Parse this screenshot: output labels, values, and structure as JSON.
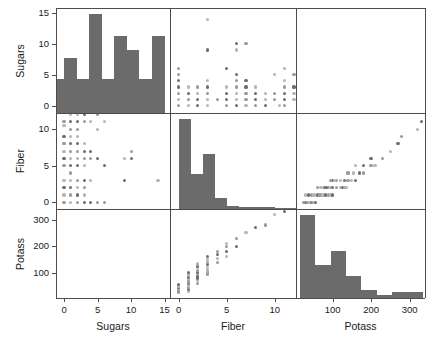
{
  "figure": {
    "type": "scatterplot-matrix",
    "variables": [
      "Sugars",
      "Fiber",
      "Potass"
    ],
    "diagonal": "histogram",
    "point_color": "#8c8c8c",
    "bar_color": "#6b6b6b",
    "frame_color": "#4d4d4d",
    "background": "#ffffff"
  },
  "labels": {
    "sugars": "Sugars",
    "fiber": "Fiber",
    "potass": "Potass"
  },
  "axes": {
    "sugars": {
      "min": -1.2,
      "max": 15.8,
      "ticks": [
        0,
        5,
        10,
        15
      ],
      "ticks_x": [
        0,
        10
      ]
    },
    "fiber": {
      "min": -0.9,
      "max": 12.2,
      "ticks": [
        0,
        5,
        10
      ],
      "ticks_x": [
        0,
        5,
        10
      ]
    },
    "potass": {
      "min": 5,
      "max": 340,
      "ticks": [
        100,
        200,
        300
      ],
      "ticks_x": [
        100,
        200,
        300
      ]
    }
  },
  "chart_data": {
    "type": "scatter",
    "title": "",
    "xlabel": "",
    "ylabel": "",
    "variables": [
      "Sugars",
      "Fiber",
      "Potass"
    ],
    "axis_ranges": {
      "Sugars": [
        -1.2,
        15.8
      ],
      "Fiber": [
        -0.9,
        12.2
      ],
      "Potass": [
        5,
        340
      ]
    },
    "tick_labels": {
      "Sugars": [
        0,
        5,
        10,
        15
      ],
      "Fiber": [
        0,
        5,
        10
      ],
      "Potass": [
        100,
        200,
        300
      ]
    },
    "grid": false,
    "legend": "none",
    "histograms": {
      "Sugars": {
        "bin_edges": [
          0,
          1.875,
          3.75,
          5.625,
          7.5,
          9.375,
          11.25,
          13.125,
          15
        ],
        "counts": [
          8.2,
          2.9,
          14.7,
          5.0,
          11.5,
          9.3,
          5.0,
          11.5
        ],
        "baseline_count": 5.0
      },
      "Fiber": {
        "bin_edges": [
          0,
          1.25,
          2.5,
          3.75,
          5.0,
          6.25,
          7.5,
          8.75,
          10,
          11.25,
          12.5,
          13.75
        ],
        "counts": [
          11.8,
          4.6,
          7.2,
          1.4,
          0.35,
          0.25,
          0.25,
          0.25,
          0.15,
          0.1,
          0.25
        ]
      },
      "Potass": {
        "bin_edges": [
          15,
          55,
          95,
          135,
          175,
          215,
          255,
          295,
          335
        ],
        "counts": [
          300,
          120,
          170,
          80,
          30,
          12,
          20,
          22
        ]
      }
    },
    "points": {
      "Sugars_Fiber": [
        [
          0.0,
          13.0
        ],
        [
          0.0,
          11.0
        ],
        [
          0.0,
          10.5
        ],
        [
          0.0,
          9.0
        ],
        [
          0.0,
          8.0
        ],
        [
          0.0,
          7.0
        ],
        [
          0.0,
          6.0
        ],
        [
          0.0,
          5.0
        ],
        [
          0.0,
          3.0
        ],
        [
          0.0,
          2.0
        ],
        [
          0.0,
          0.0
        ],
        [
          0.0,
          1.0
        ],
        [
          1.0,
          14.0
        ],
        [
          1.0,
          13.0
        ],
        [
          1.0,
          12.0
        ],
        [
          1.0,
          11.0
        ],
        [
          1.0,
          10.0
        ],
        [
          1.0,
          9.0
        ],
        [
          1.0,
          8.0
        ],
        [
          1.0,
          7.0
        ],
        [
          1.0,
          6.0
        ],
        [
          1.0,
          5.0
        ],
        [
          1.0,
          4.0
        ],
        [
          1.0,
          3.0
        ],
        [
          1.0,
          2.0
        ],
        [
          1.0,
          1.0
        ],
        [
          1.0,
          0.0
        ],
        [
          2.0,
          15.0
        ],
        [
          2.0,
          14.0
        ],
        [
          2.0,
          12.0
        ],
        [
          2.0,
          11.0
        ],
        [
          2.0,
          10.0
        ],
        [
          2.0,
          9.0
        ],
        [
          2.0,
          8.0
        ],
        [
          2.0,
          7.0
        ],
        [
          2.0,
          6.0
        ],
        [
          2.0,
          5.0
        ],
        [
          2.0,
          3.0
        ],
        [
          2.0,
          2.0
        ],
        [
          2.0,
          1.0
        ],
        [
          2.0,
          0.0
        ],
        [
          3.0,
          14.0
        ],
        [
          3.0,
          12.0
        ],
        [
          3.0,
          11.0
        ],
        [
          3.0,
          8.0
        ],
        [
          3.0,
          7.0
        ],
        [
          3.0,
          6.0
        ],
        [
          3.0,
          5.0
        ],
        [
          3.0,
          3.0
        ],
        [
          3.0,
          2.0
        ],
        [
          3.0,
          1.0
        ],
        [
          3.0,
          0.0
        ],
        [
          4.0,
          13.0
        ],
        [
          4.0,
          11.0
        ],
        [
          4.0,
          7.0
        ],
        [
          4.0,
          6.0
        ],
        [
          4.0,
          3.0
        ],
        [
          4.0,
          0.0
        ],
        [
          5.0,
          12.0
        ],
        [
          5.0,
          10.0
        ],
        [
          5.0,
          6.0
        ],
        [
          5.0,
          0.0
        ],
        [
          6.0,
          11.0
        ],
        [
          6.0,
          5.0
        ],
        [
          6.0,
          0.0
        ],
        [
          9.0,
          6.0
        ],
        [
          10.0,
          6.0
        ],
        [
          10.0,
          7.0
        ],
        [
          14.0,
          3.0
        ],
        [
          9.0,
          3.0
        ]
      ],
      "Sugars_Potass": [
        [
          30,
          15
        ],
        [
          35,
          14
        ],
        [
          40,
          13
        ],
        [
          45,
          13
        ],
        [
          48,
          12
        ],
        [
          50,
          14
        ],
        [
          55,
          13
        ],
        [
          58,
          12
        ],
        [
          35,
          11
        ],
        [
          42,
          11
        ],
        [
          50,
          11
        ],
        [
          60,
          10
        ],
        [
          65,
          12
        ],
        [
          70,
          11
        ],
        [
          75,
          10
        ],
        [
          45,
          9
        ],
        [
          55,
          9
        ],
        [
          62,
          8
        ],
        [
          68,
          9
        ],
        [
          72,
          8
        ],
        [
          80,
          9
        ],
        [
          90,
          8
        ],
        [
          50,
          7
        ],
        [
          60,
          7
        ],
        [
          70,
          7
        ],
        [
          78,
          6
        ],
        [
          85,
          7
        ],
        [
          95,
          6
        ],
        [
          105,
          7
        ],
        [
          115,
          6
        ],
        [
          55,
          5
        ],
        [
          65,
          5
        ],
        [
          75,
          5
        ],
        [
          85,
          5
        ],
        [
          95,
          5
        ],
        [
          110,
          5
        ],
        [
          120,
          5
        ],
        [
          130,
          4
        ],
        [
          60,
          3
        ],
        [
          72,
          3
        ],
        [
          82,
          3
        ],
        [
          92,
          3
        ],
        [
          100,
          3
        ],
        [
          115,
          3
        ],
        [
          125,
          3
        ],
        [
          140,
          3
        ],
        [
          30,
          2
        ],
        [
          45,
          2
        ],
        [
          55,
          2
        ],
        [
          65,
          2
        ],
        [
          80,
          2
        ],
        [
          95,
          2
        ],
        [
          110,
          2
        ],
        [
          125,
          2
        ],
        [
          30,
          1
        ],
        [
          40,
          1
        ],
        [
          50,
          1
        ],
        [
          55,
          1
        ],
        [
          60,
          1
        ],
        [
          70,
          1
        ],
        [
          88,
          1
        ],
        [
          100,
          1
        ],
        [
          30,
          0
        ],
        [
          38,
          0
        ],
        [
          45,
          0
        ],
        [
          52,
          0
        ],
        [
          60,
          0
        ],
        [
          75,
          0
        ],
        [
          90,
          0
        ],
        [
          105,
          0
        ],
        [
          125,
          0
        ],
        [
          140,
          0
        ],
        [
          160,
          5
        ],
        [
          175,
          8
        ],
        [
          190,
          3
        ],
        [
          230,
          2
        ],
        [
          280,
          5
        ],
        [
          320,
          4
        ],
        [
          330,
          5
        ],
        [
          200,
          12
        ],
        [
          205,
          13
        ]
      ],
      "Fiber_Potass": [
        [
          0.0,
          30
        ],
        [
          0.0,
          35
        ],
        [
          0.0,
          40
        ],
        [
          0.0,
          45
        ],
        [
          0.0,
          48
        ],
        [
          0.0,
          50
        ],
        [
          0.0,
          55
        ],
        [
          0.0,
          25
        ],
        [
          1.0,
          30
        ],
        [
          1.0,
          38
        ],
        [
          1.0,
          45
        ],
        [
          1.0,
          52
        ],
        [
          1.0,
          60
        ],
        [
          1.0,
          68
        ],
        [
          1.0,
          75
        ],
        [
          1.0,
          82
        ],
        [
          1.0,
          90
        ],
        [
          1.0,
          95
        ],
        [
          1.0,
          100
        ],
        [
          2.0,
          60
        ],
        [
          2.0,
          70
        ],
        [
          2.0,
          80
        ],
        [
          2.0,
          90
        ],
        [
          2.0,
          95
        ],
        [
          2.0,
          100
        ],
        [
          2.0,
          110
        ],
        [
          2.0,
          120
        ],
        [
          2.0,
          125
        ],
        [
          2.0,
          130
        ],
        [
          2.0,
          135
        ],
        [
          3.0,
          100
        ],
        [
          3.0,
          110
        ],
        [
          3.0,
          120
        ],
        [
          3.0,
          130
        ],
        [
          3.0,
          140
        ],
        [
          3.0,
          150
        ],
        [
          3.0,
          160
        ],
        [
          4.0,
          140
        ],
        [
          4.0,
          155
        ],
        [
          4.0,
          170
        ],
        [
          4.0,
          180
        ],
        [
          5.0,
          160
        ],
        [
          5.0,
          180
        ],
        [
          5.0,
          200
        ],
        [
          5.0,
          210
        ],
        [
          6.0,
          200
        ],
        [
          6.0,
          230
        ],
        [
          7.0,
          250
        ],
        [
          8.0,
          270
        ],
        [
          9.0,
          280
        ],
        [
          10.0,
          320
        ],
        [
          11.0,
          330
        ],
        [
          3.0,
          95
        ],
        [
          3.0,
          105
        ],
        [
          2.0,
          85
        ],
        [
          1.0,
          65
        ]
      ]
    }
  }
}
